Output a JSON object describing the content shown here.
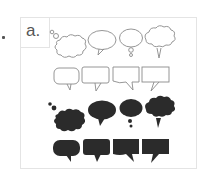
{
  "panel": {
    "label": "a.",
    "title": "Speech bubble icon set"
  },
  "rows": [
    {
      "style": "outline",
      "shapes": [
        "thought-cloud",
        "oval-speech",
        "thought-oval",
        "cloud-speech"
      ]
    },
    {
      "style": "outline",
      "shapes": [
        "rounded-rect-speech",
        "rect-speech",
        "wavy-rect-speech",
        "square-speech"
      ]
    },
    {
      "style": "filled",
      "shapes": [
        "thought-cloud",
        "oval-speech",
        "thought-oval",
        "cloud-speech"
      ]
    },
    {
      "style": "filled",
      "shapes": [
        "rounded-rect-speech",
        "rect-speech",
        "wavy-rect-speech",
        "square-speech"
      ]
    }
  ],
  "colors": {
    "outline": "#8a8a8a",
    "fill": "#2b2b2b",
    "frame": "#e4e4e4",
    "label": "#555555"
  }
}
